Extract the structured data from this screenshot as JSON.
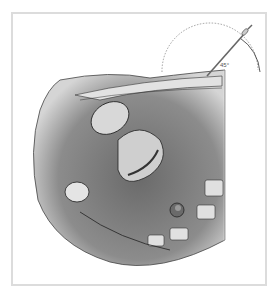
{
  "illustration": {
    "subject": "sagittal pelvic cross-section with angled needle insertion",
    "angle_label": "45°",
    "colors": {
      "frame": "#dcdcdc",
      "tissue_dark": "#5a5a5a",
      "tissue_mid": "#8a8a8a",
      "tissue_light": "#d8d8d8",
      "organ_fill": "#cfcfcf",
      "outline": "#2a2a2a"
    }
  }
}
